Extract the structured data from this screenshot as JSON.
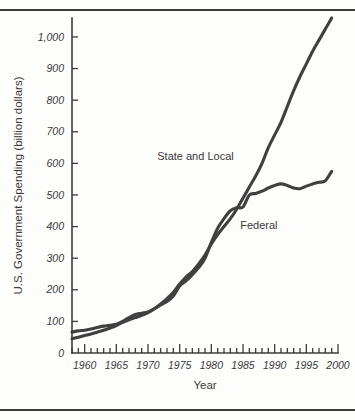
{
  "figure": {
    "background_color": "#fdfdfc",
    "stroke_color": "#404040",
    "axis_color": "#3c3c3c"
  },
  "chart_data": {
    "type": "line",
    "title": "",
    "xlabel": "Year",
    "ylabel": "U.S. Government Spending (billion dollars)",
    "xlim": [
      1958,
      2000
    ],
    "ylim": [
      0,
      1060
    ],
    "grid": false,
    "legend_position": "inline-labels",
    "ytick_labels": [
      "0",
      "100",
      "200",
      "300",
      "400",
      "500",
      "600",
      "700",
      "800",
      "900",
      "1,000"
    ],
    "ytick_values": [
      0,
      100,
      200,
      300,
      400,
      500,
      600,
      700,
      800,
      900,
      1000
    ],
    "xtick_labels": [
      "1960",
      "1965",
      "1970",
      "1975",
      "1980",
      "1985",
      "1990",
      "1995",
      "2000"
    ],
    "xtick_values": [
      1960,
      1965,
      1970,
      1975,
      1980,
      1985,
      1990,
      1995,
      2000
    ],
    "minor_tick_interval": 1,
    "x": [
      1958,
      1959,
      1960,
      1961,
      1962,
      1963,
      1964,
      1965,
      1966,
      1967,
      1968,
      1969,
      1970,
      1971,
      1972,
      1973,
      1974,
      1975,
      1976,
      1977,
      1978,
      1979,
      1980,
      1981,
      1982,
      1983,
      1984,
      1985,
      1986,
      1987,
      1988,
      1989,
      1990,
      1991,
      1992,
      1993,
      1994,
      1995,
      1996,
      1997,
      1998,
      1999
    ],
    "series": [
      {
        "name": "Federal",
        "label": "Federal",
        "values": [
          66,
          70,
          72,
          76,
          81,
          85,
          88,
          91,
          100,
          112,
          122,
          126,
          130,
          140,
          152,
          163,
          180,
          212,
          228,
          248,
          270,
          300,
          350,
          395,
          425,
          450,
          460,
          462,
          500,
          505,
          512,
          522,
          530,
          535,
          530,
          522,
          520,
          528,
          535,
          540,
          545,
          575
        ]
      },
      {
        "name": "State and Local",
        "label": "State and Local",
        "values": [
          45,
          50,
          55,
          60,
          66,
          72,
          79,
          87,
          97,
          105,
          112,
          119,
          128,
          140,
          155,
          172,
          192,
          218,
          240,
          258,
          282,
          310,
          345,
          375,
          400,
          425,
          455,
          490,
          525,
          560,
          600,
          650,
          690,
          730,
          780,
          830,
          875,
          915,
          955,
          990,
          1025,
          1060
        ]
      }
    ],
    "annotations": [
      {
        "text": "State and Local",
        "x_year": 1977.5,
        "y_value": 610
      },
      {
        "text": "Federal",
        "x_year": 1987.5,
        "y_value": 392
      }
    ]
  }
}
